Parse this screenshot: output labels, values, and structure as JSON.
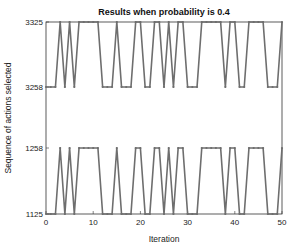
{
  "chart_data": {
    "type": "line",
    "title": "Results when probability is 0.4",
    "xlabel": "Iteration",
    "ylabel": "Sequence of actions selected",
    "xlim": [
      0,
      50
    ],
    "x_ticks": [
      0,
      10,
      20,
      30,
      40,
      50
    ],
    "y_ticks": [
      "1125",
      "1258",
      "3258",
      "3325"
    ],
    "y_axis_note": "categorical levels, top to bottom: 3325, 3258, 1258, 1125",
    "grid": false,
    "x": [
      0,
      1,
      2,
      3,
      4,
      5,
      6,
      7,
      8,
      9,
      10,
      11,
      12,
      13,
      14,
      15,
      16,
      17,
      18,
      19,
      20,
      21,
      22,
      23,
      24,
      25,
      26,
      27,
      28,
      29,
      30,
      31,
      32,
      33,
      34,
      35,
      36,
      37,
      38,
      39,
      40,
      41,
      42,
      43,
      44,
      45,
      46,
      47,
      48,
      49,
      50
    ],
    "series": [
      {
        "name": "upper action",
        "levels": [
          "3258",
          "3325"
        ],
        "values": [
          3258,
          3258,
          3258,
          3325,
          3258,
          3325,
          3258,
          3325,
          3325,
          3325,
          3325,
          3325,
          3258,
          3258,
          3258,
          3325,
          3258,
          3258,
          3258,
          3325,
          3325,
          3258,
          3258,
          3325,
          3325,
          3258,
          3325,
          3258,
          3325,
          3325,
          3258,
          3258,
          3258,
          3325,
          3325,
          3325,
          3325,
          3325,
          3258,
          3325,
          3325,
          3258,
          3258,
          3325,
          3325,
          3325,
          3325,
          3258,
          3258,
          3258,
          3325
        ]
      },
      {
        "name": "lower action",
        "levels": [
          "1125",
          "1258"
        ],
        "values": [
          1125,
          1125,
          1125,
          1258,
          1125,
          1258,
          1125,
          1258,
          1258,
          1258,
          1258,
          1258,
          1125,
          1125,
          1125,
          1258,
          1125,
          1125,
          1125,
          1258,
          1258,
          1125,
          1125,
          1258,
          1258,
          1125,
          1258,
          1125,
          1258,
          1258,
          1125,
          1125,
          1125,
          1258,
          1258,
          1258,
          1258,
          1258,
          1125,
          1258,
          1258,
          1125,
          1125,
          1258,
          1258,
          1258,
          1258,
          1125,
          1125,
          1125,
          1258
        ]
      }
    ],
    "colors": {
      "line": "#6e6e6e",
      "marker": "#6e6e6e",
      "axis": "#333333"
    }
  }
}
